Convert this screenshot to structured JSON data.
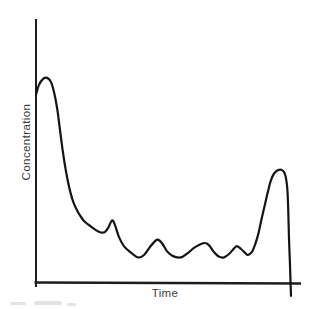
{
  "colors": {
    "curve": "#141414",
    "axis": "#1d1d1d",
    "label_text": "#3c3c3c",
    "background": "#ffffff"
  },
  "chart_data": {
    "type": "line",
    "title": "",
    "xlabel": "Time",
    "ylabel": "Concentration",
    "x_range": [
      0,
      100
    ],
    "y_range": [
      0,
      100
    ],
    "units": "arbitrary (sketch; no tick marks or tick labels shown)",
    "grid": false,
    "legend_position": "none",
    "axis_ticks": "none",
    "series": [
      {
        "name": "concentration-vs-time-curve",
        "points": [
          [
            0,
            71.4
          ],
          [
            1.1,
            75.2
          ],
          [
            2.7,
            77.5
          ],
          [
            4.2,
            77.9
          ],
          [
            5.7,
            76.3
          ],
          [
            6.8,
            72.5
          ],
          [
            8,
            66.4
          ],
          [
            9.1,
            58
          ],
          [
            10.2,
            49.6
          ],
          [
            11.4,
            42
          ],
          [
            12.9,
            34.7
          ],
          [
            14.4,
            29.8
          ],
          [
            16.3,
            26
          ],
          [
            18.2,
            23.3
          ],
          [
            20.5,
            21.4
          ],
          [
            22.7,
            19.8
          ],
          [
            24.6,
            18.9
          ],
          [
            26.1,
            19.1
          ],
          [
            27.3,
            20.6
          ],
          [
            28.8,
            23.5
          ],
          [
            29.9,
            21.8
          ],
          [
            31.4,
            17.2
          ],
          [
            33.3,
            13.7
          ],
          [
            35.6,
            11.5
          ],
          [
            38.6,
            9.4
          ],
          [
            40.9,
            10.3
          ],
          [
            43.2,
            13.4
          ],
          [
            45.1,
            15.6
          ],
          [
            46.2,
            16.2
          ],
          [
            47.7,
            14.9
          ],
          [
            49.6,
            11.8
          ],
          [
            51.5,
            10.1
          ],
          [
            53.4,
            9.4
          ],
          [
            55.3,
            9.5
          ],
          [
            57.6,
            11.1
          ],
          [
            59.8,
            13
          ],
          [
            62.1,
            14.3
          ],
          [
            64,
            14.9
          ],
          [
            65.5,
            14.1
          ],
          [
            67.4,
            11.5
          ],
          [
            69.3,
            9.7
          ],
          [
            71.2,
            9.4
          ],
          [
            73.1,
            10.7
          ],
          [
            75,
            12.8
          ],
          [
            76.1,
            13.7
          ],
          [
            77.7,
            12.6
          ],
          [
            79.2,
            11.1
          ],
          [
            80.3,
            10.3
          ],
          [
            81.8,
            11.5
          ],
          [
            82.9,
            14.1
          ],
          [
            84.1,
            17.9
          ],
          [
            85.2,
            22.9
          ],
          [
            86.4,
            28.2
          ],
          [
            87.9,
            34.7
          ],
          [
            89,
            38.9
          ],
          [
            90.2,
            41.4
          ],
          [
            91.7,
            42.7
          ],
          [
            93.2,
            42.7
          ],
          [
            94.3,
            41.2
          ],
          [
            95.1,
            36.6
          ],
          [
            95.5,
            29.4
          ],
          [
            95.8,
            17.9
          ],
          [
            96.2,
            6.5
          ],
          [
            96.6,
            -5.3
          ]
        ]
      }
    ],
    "features": {
      "curve_starts_on_y_axis_at": [
        0,
        71.4
      ],
      "initial_peak": [
        4.2,
        77.9
      ],
      "small_bump_peaks_x": [
        28.8,
        46.2,
        64.0,
        76.1
      ],
      "final_peak": [
        92.5,
        42.7
      ],
      "final_stroke_overshoots_baseline": true
    }
  }
}
